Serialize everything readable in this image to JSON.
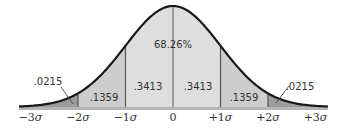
{
  "diagram": {
    "center_label": "68.26%",
    "regions": [
      {
        "id": "left-tail",
        "from_sigma": -3,
        "to_sigma": -2,
        "label": ".0215",
        "fill": "#9c9c9c"
      },
      {
        "id": "left-mid",
        "from_sigma": -2,
        "to_sigma": -1,
        "label": ".1359",
        "fill": "#cdcdcd"
      },
      {
        "id": "left-center",
        "from_sigma": -1,
        "to_sigma": 0,
        "label": ".3413",
        "fill": "#dedede"
      },
      {
        "id": "right-center",
        "from_sigma": 0,
        "to_sigma": 1,
        "label": ".3413",
        "fill": "#dedede"
      },
      {
        "id": "right-mid",
        "from_sigma": 1,
        "to_sigma": 2,
        "label": ".1359",
        "fill": "#cdcdcd"
      },
      {
        "id": "right-tail",
        "from_sigma": 2,
        "to_sigma": 3,
        "label": ".0215",
        "fill": "#9c9c9c"
      }
    ],
    "axis_ticks": [
      {
        "sigma": -3,
        "sign": "−3",
        "symbol": "σ"
      },
      {
        "sigma": -2,
        "sign": "−2",
        "symbol": "σ"
      },
      {
        "sigma": -1,
        "sign": "−1",
        "symbol": "σ"
      },
      {
        "sigma": 0,
        "sign": "0",
        "symbol": ""
      },
      {
        "sigma": 1,
        "sign": "+1",
        "symbol": "σ"
      },
      {
        "sigma": 2,
        "sign": "+2",
        "symbol": "σ"
      },
      {
        "sigma": 3,
        "sign": "+3",
        "symbol": "σ"
      }
    ],
    "colors": {
      "curve": "#1a1a1a",
      "divider": "#555555",
      "baseline": "#b5b5b5",
      "text": "#333333"
    }
  }
}
